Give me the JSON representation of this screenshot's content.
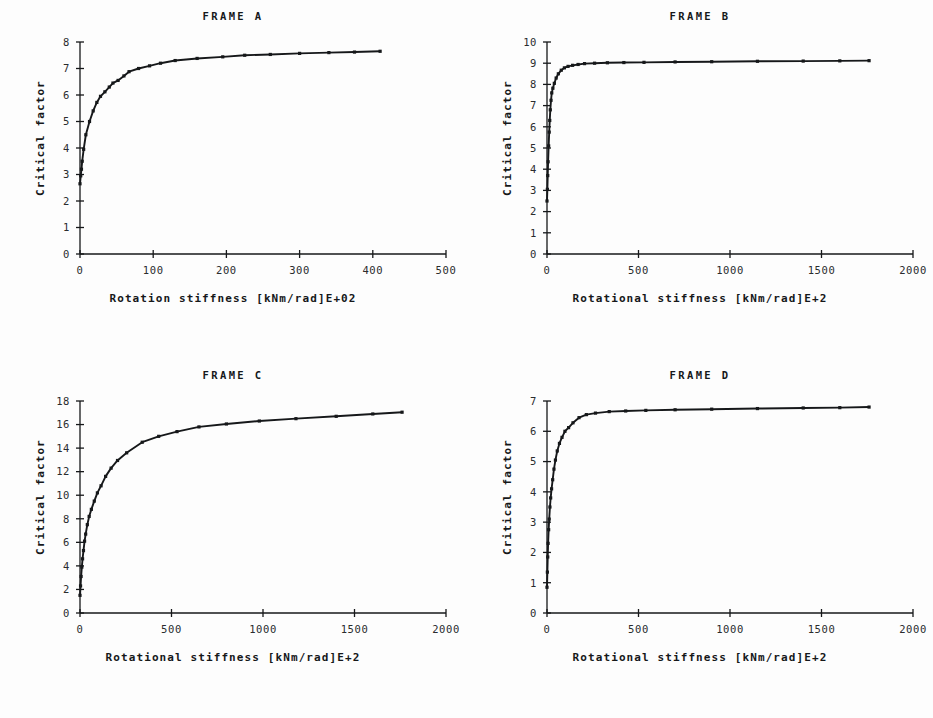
{
  "figure": {
    "background_color": "#fdfdfd",
    "ink_color": "#16181a",
    "panel_count": 4
  },
  "chart_data": [
    {
      "id": "frame-a",
      "type": "line",
      "title": "FRAME A",
      "xlabel": "Rotation stiffness [kNm/rad]E+02",
      "ylabel": "Critical factor",
      "xlim": [
        0,
        500
      ],
      "ylim": [
        0,
        8
      ],
      "xticks": [
        0,
        100,
        200,
        300,
        400,
        500
      ],
      "xtick_labels": [
        "0",
        "100",
        "200",
        "300",
        "400",
        "500"
      ],
      "yticks": [
        0,
        1,
        2,
        3,
        4,
        5,
        6,
        7,
        8
      ],
      "ytick_labels": [
        "0",
        "1",
        "2",
        "3",
        "4",
        "5",
        "6",
        "7",
        "8"
      ],
      "grid": false,
      "legend": null,
      "marker": "square",
      "x": [
        0,
        1,
        2,
        3,
        5,
        8,
        13,
        18,
        23,
        28,
        34,
        40,
        45,
        52,
        60,
        67,
        80,
        95,
        110,
        130,
        160,
        195,
        225,
        260,
        300,
        340,
        375,
        410
      ],
      "y": [
        2.65,
        2.95,
        3.2,
        3.5,
        3.95,
        4.5,
        5.0,
        5.4,
        5.72,
        5.95,
        6.12,
        6.3,
        6.45,
        6.55,
        6.72,
        6.88,
        7.0,
        7.1,
        7.2,
        7.3,
        7.38,
        7.44,
        7.5,
        7.53,
        7.57,
        7.6,
        7.62,
        7.65
      ]
    },
    {
      "id": "frame-b",
      "type": "line",
      "title": "FRAME B",
      "xlabel": "Rotational stiffness [kNm/rad]E+2",
      "ylabel": "Critical factor",
      "xlim": [
        0,
        2000
      ],
      "ylim": [
        0,
        10
      ],
      "xticks": [
        0,
        500,
        1000,
        1500,
        2000
      ],
      "xtick_labels": [
        "0",
        "500",
        "1000",
        "1500",
        "2000"
      ],
      "yticks": [
        0,
        1,
        2,
        3,
        4,
        5,
        6,
        7,
        8,
        9,
        10
      ],
      "ytick_labels": [
        "0",
        "1",
        "2",
        "3",
        "4",
        "5",
        "6",
        "7",
        "8",
        "9",
        "10"
      ],
      "grid": false,
      "legend": null,
      "marker": "square",
      "x": [
        0,
        2,
        4,
        6,
        9,
        12,
        15,
        18,
        22,
        26,
        32,
        40,
        50,
        62,
        78,
        95,
        115,
        140,
        170,
        205,
        260,
        330,
        420,
        530,
        700,
        900,
        1150,
        1400,
        1600,
        1760
      ],
      "y": [
        2.5,
        3.05,
        3.7,
        4.35,
        5.1,
        5.75,
        6.3,
        6.8,
        7.25,
        7.6,
        7.82,
        8.05,
        8.3,
        8.5,
        8.67,
        8.78,
        8.85,
        8.9,
        8.94,
        8.98,
        9.0,
        9.02,
        9.03,
        9.04,
        9.06,
        9.07,
        9.09,
        9.1,
        9.11,
        9.12
      ]
    },
    {
      "id": "frame-c",
      "type": "line",
      "title": "FRAME C",
      "xlabel": "Rotational stiffness [kNm/rad]E+2",
      "ylabel": "Critical factor",
      "xlim": [
        0,
        2000
      ],
      "ylim": [
        0,
        18
      ],
      "xticks": [
        0,
        500,
        1000,
        1500,
        2000
      ],
      "xtick_labels": [
        "0",
        "500",
        "1000",
        "1500",
        "2000"
      ],
      "yticks": [
        0,
        2,
        4,
        6,
        8,
        10,
        12,
        14,
        16,
        18
      ],
      "ytick_labels": [
        "0",
        "2",
        "4",
        "6",
        "8",
        "10",
        "12",
        "14",
        "16",
        "18"
      ],
      "grid": false,
      "legend": null,
      "marker": "square",
      "x": [
        0,
        3,
        6,
        10,
        14,
        19,
        25,
        31,
        40,
        50,
        62,
        78,
        95,
        115,
        140,
        170,
        205,
        255,
        340,
        430,
        530,
        650,
        800,
        980,
        1180,
        1400,
        1600,
        1760
      ],
      "y": [
        1.5,
        2.3,
        3.1,
        3.9,
        4.6,
        5.3,
        6.1,
        6.7,
        7.5,
        8.2,
        8.8,
        9.5,
        10.2,
        10.8,
        11.6,
        12.3,
        12.95,
        13.6,
        14.5,
        15.0,
        15.4,
        15.8,
        16.05,
        16.3,
        16.5,
        16.7,
        16.9,
        17.05
      ]
    },
    {
      "id": "frame-d",
      "type": "line",
      "title": "FRAME D",
      "xlabel": "Rotational stiffness [kNm/rad]E+2",
      "ylabel": "Critical factor",
      "xlim": [
        0,
        2000
      ],
      "ylim": [
        0,
        7
      ],
      "xticks": [
        0,
        500,
        1000,
        1500,
        2000
      ],
      "xtick_labels": [
        "0",
        "500",
        "1000",
        "1500",
        "2000"
      ],
      "yticks": [
        0,
        1,
        2,
        3,
        4,
        5,
        6,
        7
      ],
      "ytick_labels": [
        "0",
        "1",
        "2",
        "3",
        "4",
        "5",
        "6",
        "7"
      ],
      "grid": false,
      "legend": null,
      "marker": "square",
      "x": [
        0,
        2,
        4,
        6,
        9,
        12,
        16,
        20,
        25,
        31,
        38,
        46,
        56,
        68,
        82,
        98,
        118,
        142,
        175,
        215,
        265,
        340,
        430,
        540,
        700,
        900,
        1150,
        1400,
        1600,
        1760
      ],
      "y": [
        0.85,
        1.35,
        1.85,
        2.3,
        2.75,
        3.1,
        3.5,
        3.8,
        4.1,
        4.4,
        4.75,
        5.05,
        5.35,
        5.6,
        5.8,
        6.0,
        6.12,
        6.28,
        6.45,
        6.55,
        6.6,
        6.65,
        6.67,
        6.69,
        6.71,
        6.73,
        6.75,
        6.77,
        6.78,
        6.8
      ]
    }
  ]
}
